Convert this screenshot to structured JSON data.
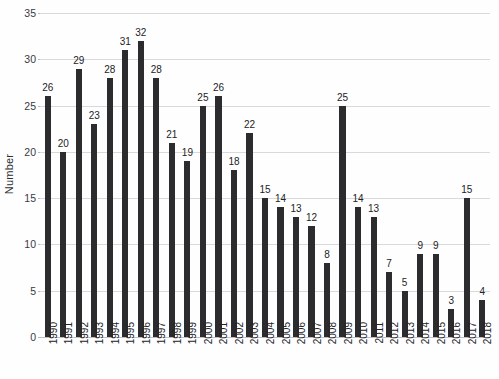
{
  "chart_data": {
    "type": "bar",
    "title": "",
    "xlabel": "",
    "ylabel": "Number",
    "ylim": [
      0,
      35
    ],
    "ytick_step": 5,
    "yticks": [
      0,
      5,
      10,
      15,
      20,
      25,
      30,
      35
    ],
    "grid": true,
    "legend": null,
    "bar_color": "#2c2c2e",
    "gridline_color": "#d9d9dc",
    "background_color": "#fefefe",
    "categories": [
      "1990",
      "1991",
      "1992",
      "1993",
      "1994",
      "1995",
      "1996",
      "1997",
      "1998",
      "1999",
      "2000",
      "2001",
      "2002",
      "2003",
      "2004",
      "2005",
      "2006",
      "2007",
      "2008",
      "2009",
      "2010",
      "2011",
      "2012",
      "2013",
      "2014",
      "2015",
      "2016",
      "2017",
      "2018"
    ],
    "values": [
      26,
      20,
      29,
      23,
      28,
      31,
      32,
      28,
      21,
      19,
      25,
      26,
      18,
      22,
      15,
      14,
      13,
      12,
      8,
      25,
      14,
      13,
      7,
      5,
      9,
      9,
      3,
      15,
      4
    ],
    "data_labels_shown": true
  }
}
